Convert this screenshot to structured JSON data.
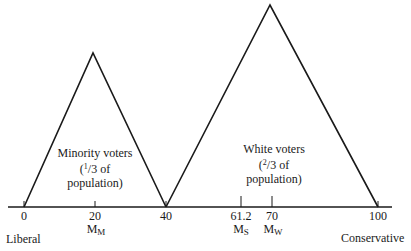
{
  "diagram": {
    "type": "voter-distribution",
    "axis": {
      "left_label": "Liberal",
      "right_label": "Conservative",
      "ticks": [
        {
          "value": "0",
          "marker": ""
        },
        {
          "value": "20",
          "marker": "M",
          "marker_sub": "M"
        },
        {
          "value": "40",
          "marker": ""
        },
        {
          "value": "61.2",
          "marker": "M",
          "marker_sub": "S"
        },
        {
          "value": "70",
          "marker": "M",
          "marker_sub": "W"
        },
        {
          "value": "100",
          "marker": ""
        }
      ]
    },
    "groups": [
      {
        "name": "Minority voters",
        "frac_num": "1",
        "frac_den": "3",
        "frac_suffix": "of",
        "line2_open": "(",
        "line3": "population)",
        "range": [
          0,
          40
        ],
        "peak": 20
      },
      {
        "name": "White voters",
        "frac_num": "2",
        "frac_den": "3",
        "frac_suffix": "of",
        "line2_open": "(",
        "line3": "population)",
        "range": [
          40,
          100
        ],
        "peak": 70
      }
    ]
  }
}
